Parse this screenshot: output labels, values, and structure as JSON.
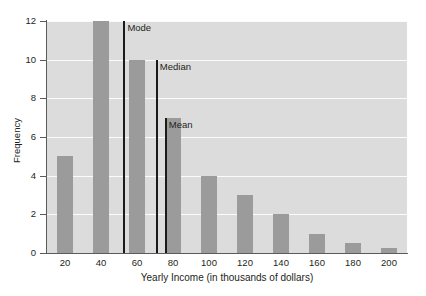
{
  "chart_data": {
    "type": "bar",
    "title": "",
    "subtitle": "",
    "xlabel": "Yearly Income (in thousands of dollars)",
    "ylabel": "Frequency",
    "categories": [
      "20",
      "40",
      "60",
      "80",
      "100",
      "120",
      "140",
      "160",
      "180",
      "200"
    ],
    "values": [
      5,
      12,
      10,
      7,
      4,
      3,
      2,
      1,
      0.5,
      0.25
    ],
    "xlim": [
      10,
      210
    ],
    "ylim": [
      0,
      12
    ],
    "xticks": [
      "20",
      "40",
      "60",
      "80",
      "100",
      "120",
      "140",
      "160",
      "180",
      "200"
    ],
    "yticks": [
      "0",
      "2",
      "4",
      "6",
      "8",
      "10",
      "12"
    ],
    "grid": true,
    "legend": "none",
    "annotations": [
      {
        "label": "Mode",
        "x": 53,
        "value_y": 12
      },
      {
        "label": "Median",
        "x": 71,
        "value_y": 10
      },
      {
        "label": "Mean",
        "x": 76,
        "value_y": 7
      }
    ],
    "colors": {
      "bar_fill": "#9b9b9b",
      "plot_background": "#dcdcdc",
      "gridline": "#fbfbfb",
      "axis": "#5b5b5b",
      "marker_line": "#1a1a1a",
      "text": "#231f20",
      "page_background": "#ffffff"
    }
  },
  "axes": {
    "y_title": "Frequency",
    "x_title": "Yearly Income (in thousands of dollars)",
    "y_ticks": [
      {
        "label": "12",
        "value": 12
      },
      {
        "label": "10",
        "value": 10
      },
      {
        "label": "8",
        "value": 8
      },
      {
        "label": "6",
        "value": 6
      },
      {
        "label": "4",
        "value": 4
      },
      {
        "label": "2",
        "value": 2
      },
      {
        "label": "0",
        "value": 0
      }
    ],
    "x_ticks": [
      {
        "label": "20",
        "value": 20
      },
      {
        "label": "40",
        "value": 40
      },
      {
        "label": "60",
        "value": 60
      },
      {
        "label": "80",
        "value": 80
      },
      {
        "label": "100",
        "value": 100
      },
      {
        "label": "120",
        "value": 120
      },
      {
        "label": "140",
        "value": 140
      },
      {
        "label": "160",
        "value": 160
      },
      {
        "label": "180",
        "value": 180
      },
      {
        "label": "200",
        "value": 200
      }
    ]
  },
  "markers": [
    {
      "name": "mode",
      "label": "Mode"
    },
    {
      "name": "median",
      "label": "Median"
    },
    {
      "name": "mean",
      "label": "Mean"
    }
  ]
}
